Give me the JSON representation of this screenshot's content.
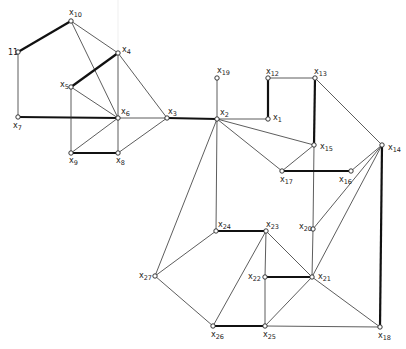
{
  "diagram": {
    "type": "graph",
    "nodes": [
      {
        "id": "x1",
        "base": "x",
        "sub": "1",
        "x": 268,
        "y": 119,
        "lx": 273,
        "ly": 120
      },
      {
        "id": "x2",
        "base": "x",
        "sub": "2",
        "x": 217,
        "y": 119,
        "lx": 220,
        "ly": 115
      },
      {
        "id": "x3",
        "base": "x",
        "sub": "3",
        "x": 167,
        "y": 118,
        "lx": 168,
        "ly": 114
      },
      {
        "id": "x4",
        "base": "x",
        "sub": "4",
        "x": 118,
        "y": 53,
        "lx": 122,
        "ly": 52
      },
      {
        "id": "x5",
        "base": "x",
        "sub": "5",
        "x": 71,
        "y": 87,
        "lx": 60,
        "ly": 87
      },
      {
        "id": "x6",
        "base": "x",
        "sub": "6",
        "x": 118,
        "y": 118,
        "lx": 121,
        "ly": 114
      },
      {
        "id": "x7",
        "base": "x",
        "sub": "7",
        "x": 18,
        "y": 117,
        "lx": 13,
        "ly": 128
      },
      {
        "id": "x8",
        "base": "x",
        "sub": "8",
        "x": 118,
        "y": 153,
        "lx": 116,
        "ly": 163
      },
      {
        "id": "x9",
        "base": "x",
        "sub": "9",
        "x": 71,
        "y": 153,
        "lx": 69,
        "ly": 163
      },
      {
        "id": "x10",
        "base": "x",
        "sub": "10",
        "x": 71,
        "y": 21,
        "lx": 69,
        "ly": 15
      },
      {
        "id": "x11",
        "base": "",
        "sub": "11",
        "x": 18,
        "y": 52,
        "lx": 8,
        "ly": 55
      },
      {
        "id": "x12",
        "base": "x",
        "sub": "12",
        "x": 268,
        "y": 78,
        "lx": 266,
        "ly": 74
      },
      {
        "id": "x13",
        "base": "x",
        "sub": "13",
        "x": 315,
        "y": 78,
        "lx": 314,
        "ly": 74
      },
      {
        "id": "x14",
        "base": "x",
        "sub": "14",
        "x": 382,
        "y": 145,
        "lx": 388,
        "ly": 150
      },
      {
        "id": "x15",
        "base": "x",
        "sub": "15",
        "x": 314,
        "y": 145,
        "lx": 320,
        "ly": 149
      },
      {
        "id": "x16",
        "base": "x",
        "sub": "16",
        "x": 351,
        "y": 171,
        "lx": 339,
        "ly": 182
      },
      {
        "id": "x17",
        "base": "x",
        "sub": "17",
        "x": 282,
        "y": 171,
        "lx": 280,
        "ly": 182
      },
      {
        "id": "x18",
        "base": "x",
        "sub": "18",
        "x": 380,
        "y": 327,
        "lx": 378,
        "ly": 338
      },
      {
        "id": "x19",
        "base": "x",
        "sub": "19",
        "x": 217,
        "y": 78,
        "lx": 217,
        "ly": 73
      },
      {
        "id": "x20",
        "base": "x",
        "sub": "20",
        "x": 313,
        "y": 229,
        "lx": 299,
        "ly": 229
      },
      {
        "id": "x21",
        "base": "x",
        "sub": "21",
        "x": 312,
        "y": 277,
        "lx": 318,
        "ly": 279
      },
      {
        "id": "x22",
        "base": "x",
        "sub": "22",
        "x": 265,
        "y": 277,
        "lx": 248,
        "ly": 279
      },
      {
        "id": "x23",
        "base": "x",
        "sub": "23",
        "x": 266,
        "y": 231,
        "lx": 266,
        "ly": 227
      },
      {
        "id": "x24",
        "base": "x",
        "sub": "24",
        "x": 216,
        "y": 231,
        "lx": 218,
        "ly": 227
      },
      {
        "id": "x25",
        "base": "x",
        "sub": "25",
        "x": 265,
        "y": 326,
        "lx": 263,
        "ly": 337
      },
      {
        "id": "x26",
        "base": "x",
        "sub": "26",
        "x": 213,
        "y": 326,
        "lx": 211,
        "ly": 337
      },
      {
        "id": "x27",
        "base": "x",
        "sub": "27",
        "x": 155,
        "y": 276,
        "lx": 139,
        "ly": 278
      }
    ],
    "edges": [
      {
        "from": "x10",
        "to": "x11",
        "thick": true
      },
      {
        "from": "x11",
        "to": "x7",
        "thick": false
      },
      {
        "from": "x7",
        "to": "x6",
        "thick": true
      },
      {
        "from": "x10",
        "to": "x4",
        "thick": false
      },
      {
        "from": "x10",
        "to": "x6",
        "thick": false
      },
      {
        "from": "x4",
        "to": "x5",
        "thick": true
      },
      {
        "from": "x4",
        "to": "x6",
        "thick": false
      },
      {
        "from": "x4",
        "to": "x3",
        "thick": false
      },
      {
        "from": "x5",
        "to": "x6",
        "thick": false
      },
      {
        "from": "x5",
        "to": "x9",
        "thick": false
      },
      {
        "from": "x6",
        "to": "x9",
        "thick": false
      },
      {
        "from": "x6",
        "to": "x8",
        "thick": false
      },
      {
        "from": "x6",
        "to": "x3",
        "thick": false
      },
      {
        "from": "x9",
        "to": "x8",
        "thick": true
      },
      {
        "from": "x8",
        "to": "x3",
        "thick": false
      },
      {
        "from": "x3",
        "to": "x2",
        "thick": true
      },
      {
        "from": "x19",
        "to": "x2",
        "thick": false
      },
      {
        "from": "x2",
        "to": "x1",
        "thick": false
      },
      {
        "from": "x12",
        "to": "x1",
        "thick": true
      },
      {
        "from": "x12",
        "to": "x13",
        "thick": false
      },
      {
        "from": "x13",
        "to": "x15",
        "thick": true
      },
      {
        "from": "x13",
        "to": "x14",
        "thick": false
      },
      {
        "from": "x2",
        "to": "x15",
        "thick": false
      },
      {
        "from": "x2",
        "to": "x17",
        "thick": false
      },
      {
        "from": "x2",
        "to": "x24",
        "thick": false
      },
      {
        "from": "x2",
        "to": "x27",
        "thick": false
      },
      {
        "from": "x15",
        "to": "x17",
        "thick": false
      },
      {
        "from": "x15",
        "to": "x20",
        "thick": false
      },
      {
        "from": "x17",
        "to": "x16",
        "thick": true
      },
      {
        "from": "x14",
        "to": "x16",
        "thick": false
      },
      {
        "from": "x14",
        "to": "x20",
        "thick": false
      },
      {
        "from": "x14",
        "to": "x21",
        "thick": false
      },
      {
        "from": "x14",
        "to": "x18",
        "thick": true
      },
      {
        "from": "x20",
        "to": "x21",
        "thick": false
      },
      {
        "from": "x24",
        "to": "x23",
        "thick": true
      },
      {
        "from": "x24",
        "to": "x27",
        "thick": false
      },
      {
        "from": "x27",
        "to": "x26",
        "thick": false
      },
      {
        "from": "x26",
        "to": "x23",
        "thick": false
      },
      {
        "from": "x26",
        "to": "x25",
        "thick": true
      },
      {
        "from": "x23",
        "to": "x22",
        "thick": false
      },
      {
        "from": "x23",
        "to": "x21",
        "thick": false
      },
      {
        "from": "x22",
        "to": "x25",
        "thick": false
      },
      {
        "from": "x22",
        "to": "x21",
        "thick": true
      },
      {
        "from": "x25",
        "to": "x21",
        "thick": false
      },
      {
        "from": "x25",
        "to": "x18",
        "thick": false
      },
      {
        "from": "x21",
        "to": "x18",
        "thick": false
      }
    ]
  }
}
